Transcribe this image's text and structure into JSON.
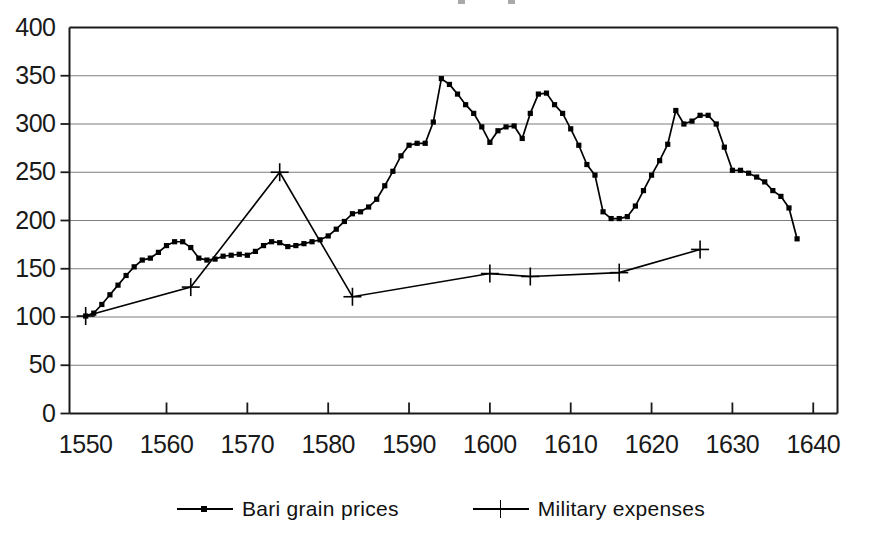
{
  "chart_data": {
    "type": "line",
    "title": "",
    "xlabel": "",
    "ylabel": "",
    "xlim": [
      1548,
      1643
    ],
    "ylim": [
      0,
      400
    ],
    "grid": true,
    "grid_axis": "y",
    "legend_position": "bottom-center",
    "yticks": [
      0,
      50,
      100,
      150,
      200,
      250,
      300,
      350,
      400
    ],
    "ytick_labels": [
      "0",
      "50",
      "100",
      "150",
      "200",
      "250",
      "300",
      "350",
      "400"
    ],
    "xticks": [
      1550,
      1560,
      1570,
      1580,
      1590,
      1600,
      1610,
      1620,
      1630,
      1640
    ],
    "xtick_labels": [
      "1550",
      "1560",
      "1570",
      "1580",
      "1590",
      "1600",
      "1610",
      "1620",
      "1630",
      "1640"
    ],
    "series": [
      {
        "name": "Bari grain prices",
        "marker": "square-dot",
        "color": "#000000",
        "x": [
          1550,
          1551,
          1552,
          1553,
          1554,
          1555,
          1556,
          1557,
          1558,
          1559,
          1560,
          1561,
          1562,
          1563,
          1564,
          1565,
          1566,
          1567,
          1568,
          1569,
          1570,
          1571,
          1572,
          1573,
          1574,
          1575,
          1576,
          1577,
          1578,
          1579,
          1580,
          1581,
          1582,
          1583,
          1584,
          1585,
          1586,
          1587,
          1588,
          1589,
          1590,
          1591,
          1592,
          1593,
          1594,
          1595,
          1596,
          1597,
          1598,
          1599,
          1600,
          1601,
          1602,
          1603,
          1604,
          1605,
          1606,
          1607,
          1608,
          1609,
          1610,
          1611,
          1612,
          1613,
          1614,
          1615,
          1616,
          1617,
          1618,
          1619,
          1620,
          1621,
          1622,
          1623,
          1624,
          1625,
          1626,
          1627,
          1628,
          1629,
          1630,
          1631,
          1632,
          1633,
          1634,
          1635,
          1636,
          1637,
          1638
        ],
        "y": [
          101,
          104,
          113,
          123,
          133,
          143,
          152,
          159,
          161,
          167,
          174,
          178,
          178,
          172,
          161,
          159,
          160,
          163,
          164,
          165,
          164,
          168,
          174,
          178,
          177,
          173,
          174,
          176,
          178,
          180,
          184,
          191,
          199,
          207,
          209,
          214,
          222,
          236,
          251,
          267,
          278,
          280,
          280,
          302,
          347,
          341,
          331,
          320,
          311,
          297,
          281,
          293,
          297,
          298,
          285,
          311,
          331,
          332,
          320,
          311,
          295,
          278,
          258,
          247,
          209,
          202,
          202,
          204,
          215,
          231,
          247,
          262,
          279,
          314,
          300,
          303,
          309,
          309,
          300,
          276,
          252,
          252,
          249,
          245,
          240,
          231,
          225,
          213,
          181
        ]
      },
      {
        "name": "Military expenses",
        "marker": "plus",
        "color": "#000000",
        "x": [
          1550,
          1563,
          1574,
          1583,
          1600,
          1605,
          1616,
          1626
        ],
        "y": [
          101,
          131,
          250,
          121,
          145,
          142,
          146,
          170
        ]
      }
    ]
  },
  "legend": {
    "entries": [
      {
        "label": "Bari grain prices",
        "marker": "square-dot"
      },
      {
        "label": "Military expenses",
        "marker": "plus"
      }
    ]
  }
}
